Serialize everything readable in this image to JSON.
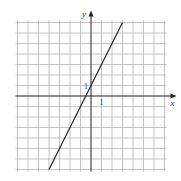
{
  "chart_data": {
    "type": "line",
    "title": "",
    "xlabel": "x",
    "ylabel": "y",
    "tick_labels": {
      "x": "1",
      "y": "1"
    },
    "xlim": [
      -7,
      7
    ],
    "ylim": [
      -7,
      7
    ],
    "grid": true,
    "series": [
      {
        "name": "line",
        "equation": "y = 2x + 1",
        "slope": 2,
        "intercept": 1,
        "x": [
          -4,
          3
        ],
        "y": [
          -7,
          7
        ]
      }
    ],
    "colors": {
      "grid": "#b5b5b5",
      "axis": "#222222",
      "line": "#2a2a2a"
    }
  },
  "labels": {
    "x_axis": "x",
    "y_axis": "y",
    "x_tick": "1",
    "y_tick": "1"
  }
}
